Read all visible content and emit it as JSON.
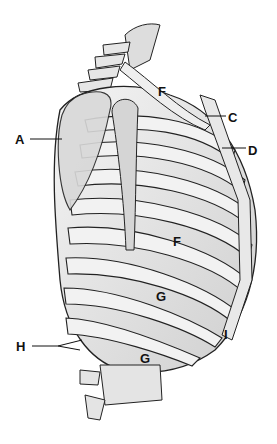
{
  "diagram": {
    "labels": [
      {
        "id": "A",
        "text": "A",
        "x": 15,
        "y": 133
      },
      {
        "id": "F1",
        "text": "F",
        "x": 158,
        "y": 85
      },
      {
        "id": "C",
        "text": "C",
        "x": 228,
        "y": 111
      },
      {
        "id": "D",
        "text": "D",
        "x": 248,
        "y": 144
      },
      {
        "id": "F2",
        "text": "F",
        "x": 173,
        "y": 235
      },
      {
        "id": "G1",
        "text": "G",
        "x": 156,
        "y": 290
      },
      {
        "id": "I",
        "text": "I",
        "x": 224,
        "y": 328
      },
      {
        "id": "H",
        "text": "H",
        "x": 16,
        "y": 340
      },
      {
        "id": "G2",
        "text": "G",
        "x": 140,
        "y": 352
      }
    ]
  }
}
